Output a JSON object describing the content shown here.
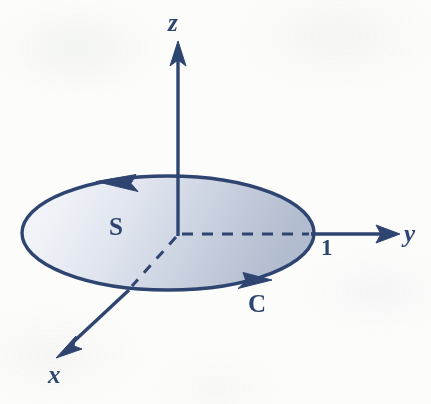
{
  "figure": {
    "background_color": "#fcfcfb",
    "stroke_color": "#2f4571",
    "surface_fill_light": "#f3f5f9",
    "surface_fill_dark": "#b4bdd0"
  },
  "axes": {
    "z": {
      "label": "z",
      "origin": {
        "x": 178,
        "y": 234
      },
      "tip": {
        "x": 178,
        "y": 44
      }
    },
    "y": {
      "label": "y",
      "start": {
        "x": 313,
        "y": 234
      },
      "tip": {
        "x": 399,
        "y": 234
      }
    },
    "x": {
      "label": "x",
      "dashed_from": {
        "x": 178,
        "y": 234
      },
      "dashed_to": {
        "x": 131,
        "y": 287
      },
      "tip": {
        "x": 58,
        "y": 357
      }
    }
  },
  "surface": {
    "label": "S",
    "label_pos": {
      "x": 118,
      "y": 227
    },
    "center": {
      "x": 168,
      "y": 233
    },
    "rx": 146,
    "ry": 57
  },
  "curve": {
    "label": "C",
    "label_pos": {
      "x": 258,
      "y": 304
    },
    "orientation": "counterclockwise-viewed-from-positive-z",
    "arrowheads": [
      {
        "name": "top-left-arrowhead",
        "x": 97,
        "y": 181,
        "direction": "left"
      },
      {
        "name": "bottom-right-arrowhead",
        "x": 258,
        "y": 283,
        "direction": "right-down"
      }
    ]
  },
  "radius_tick": {
    "label": "1",
    "pos": {
      "x": 328,
      "y": 248
    },
    "dashed_radius_from": {
      "x": 178,
      "y": 234
    },
    "dashed_radius_to": {
      "x": 311,
      "y": 234
    }
  }
}
